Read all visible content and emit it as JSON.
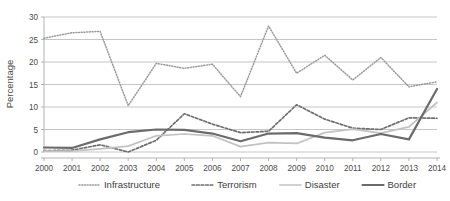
{
  "chart_data": {
    "type": "line",
    "title": "",
    "xlabel": "",
    "ylabel": "Percentage",
    "ylim": [
      0,
      30
    ],
    "ytick_step": 5,
    "yticks": [
      "0",
      "5",
      "10",
      "15",
      "20",
      "25",
      "30"
    ],
    "grid": true,
    "legend_position": "bottom",
    "x": [
      "2000",
      "2001",
      "2002",
      "2003",
      "2004",
      "2005",
      "2006",
      "2007",
      "2008",
      "2009",
      "2010",
      "2011",
      "2012",
      "2013",
      "2014"
    ],
    "categories": [
      "2000",
      "2001",
      "2002",
      "2003",
      "2004",
      "2005",
      "2006",
      "2007",
      "2008",
      "2009",
      "2010",
      "2011",
      "2012",
      "2013",
      "2014"
    ],
    "series": [
      {
        "name": "Infrastructure",
        "style": "dotted",
        "color": "#9a9a9a",
        "values": [
          25.3,
          26.5,
          26.8,
          10.3,
          19.7,
          18.6,
          19.5,
          12.3,
          28.0,
          17.5,
          21.5,
          16.0,
          21.0,
          14.5,
          15.6
        ]
      },
      {
        "name": "Terrorism",
        "style": "dashed",
        "color": "#6e6e6e",
        "values": [
          0.3,
          0.4,
          1.6,
          0.0,
          2.6,
          8.5,
          6.2,
          4.3,
          4.6,
          10.5,
          7.3,
          5.3,
          5.0,
          7.6,
          7.5
        ]
      },
      {
        "name": "Disaster",
        "style": "solid-light",
        "color": "#c2c2c2",
        "values": [
          0.2,
          0.2,
          0.7,
          1.3,
          3.6,
          4.0,
          3.6,
          1.2,
          2.1,
          1.9,
          4.3,
          5.1,
          4.2,
          5.6,
          11.0
        ]
      },
      {
        "name": "Border",
        "style": "solid-bold",
        "color": "#6b6b6b",
        "values": [
          1.0,
          0.9,
          2.8,
          4.4,
          5.0,
          4.9,
          4.1,
          2.4,
          4.1,
          4.2,
          3.2,
          2.6,
          4.0,
          2.8,
          14.0
        ]
      }
    ],
    "legend": [
      {
        "label": "Infrastructure",
        "style": "dotted",
        "color": "#9a9a9a"
      },
      {
        "label": "Terrorism",
        "style": "dashed",
        "color": "#6e6e6e"
      },
      {
        "label": "Disaster",
        "style": "solid-light",
        "color": "#c2c2c2"
      },
      {
        "label": "Border",
        "style": "solid-bold",
        "color": "#6b6b6b"
      }
    ],
    "axis_color": "#aaaaaa",
    "grid_color": "#b8b8b8",
    "background": "#ffffff"
  }
}
